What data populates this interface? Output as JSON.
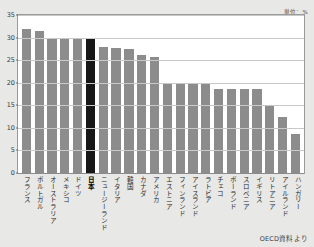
{
  "unit_label": "単位：%",
  "source_label": "OECD資料より",
  "colors": {
    "bar": "#8c8c8c",
    "highlight_bar": "#171717",
    "background": "#e8e8e6",
    "plot_background": "#ffffff",
    "gridline": "#c9c9c9",
    "frame": "#9a9a9a"
  },
  "chart_data": {
    "type": "bar",
    "title": "",
    "subtitle": "",
    "xlabel": "",
    "ylabel": "",
    "unit": "%",
    "ylim": [
      0,
      35
    ],
    "yticks": [
      0,
      5,
      10,
      15,
      20,
      25,
      30,
      35
    ],
    "ytick_labels": [
      "0",
      "5",
      "10",
      "15",
      "20",
      "25",
      "30",
      "35"
    ],
    "grid": true,
    "legend": "none",
    "annotations": [
      "単位：%",
      "OECD資料より"
    ],
    "highlight_category": "日本",
    "categories": [
      "フランス",
      "ポルトガル",
      "オーストラリア",
      "メキシコ",
      "ドイツ",
      "日本",
      "ニュージーランド",
      "イタリア",
      "韓国",
      "カナダ",
      "アメリカ",
      "エストニア",
      "フィンランド",
      "アイスランド",
      "ラトビア",
      "チェコ",
      "ポーランド",
      "スロベニア",
      "イギリス",
      "リトアニア",
      "アイルランド",
      "ハンガリー"
    ],
    "values": [
      31.9,
      31.4,
      30.0,
      30.0,
      30.0,
      29.7,
      27.9,
      27.6,
      27.4,
      26.2,
      25.6,
      19.8,
      19.8,
      19.8,
      19.8,
      18.7,
      18.7,
      18.7,
      18.7,
      14.8,
      12.3,
      8.6
    ]
  }
}
